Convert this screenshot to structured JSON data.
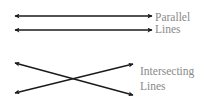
{
  "diagram": {
    "parallel": {
      "label_line1": "Parallel",
      "label_line2": "Lines",
      "lines": [
        {
          "x1": 15,
          "y1": 16,
          "x2": 152,
          "y2": 16
        },
        {
          "x1": 15,
          "y1": 30,
          "x2": 152,
          "y2": 30
        }
      ]
    },
    "intersecting": {
      "label_line1": "Intersecting",
      "label_line2": "Lines",
      "lines": [
        {
          "x1": 15,
          "y1": 63,
          "x2": 133,
          "y2": 95
        },
        {
          "x1": 15,
          "y1": 93,
          "x2": 133,
          "y2": 64
        }
      ]
    },
    "colors": {
      "line": "#1a1a1a",
      "label": "#8a8a8a",
      "background": "#ffffff"
    }
  }
}
